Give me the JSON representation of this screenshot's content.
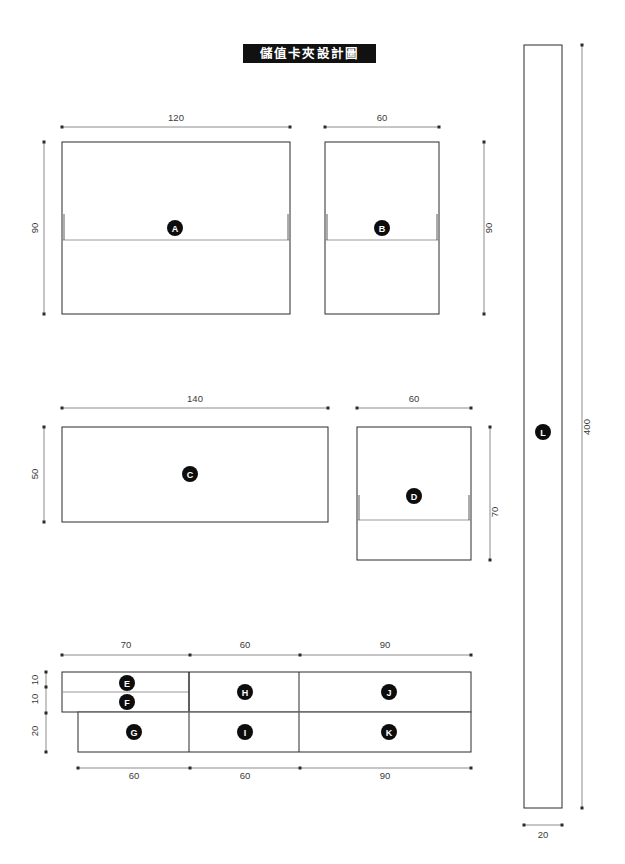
{
  "title": {
    "text": "儲值卡夾設計圖"
  },
  "drawing": {
    "type": "technical-drawing",
    "unit_note": "mm",
    "panels": [
      {
        "id": "A",
        "label": "A",
        "width": 120,
        "height": 90,
        "fold": true,
        "notches": true
      },
      {
        "id": "B",
        "label": "B",
        "width": 60,
        "height": 90,
        "fold": true,
        "notches": true
      },
      {
        "id": "C",
        "label": "C",
        "width": 140,
        "height": 50,
        "fold": false,
        "notches": false
      },
      {
        "id": "D",
        "label": "D",
        "width": 60,
        "height": 70,
        "fold": true,
        "notches": true
      },
      {
        "id": "E",
        "label": "E",
        "width": 70,
        "height": 10,
        "fold": false,
        "notches": false
      },
      {
        "id": "F",
        "label": "F",
        "width": 70,
        "height": 10,
        "fold": false,
        "notches": false
      },
      {
        "id": "G",
        "label": "G",
        "width": 60,
        "height": 20,
        "fold": false,
        "notches": false
      },
      {
        "id": "H",
        "label": "H",
        "width": 60,
        "height": 20,
        "fold": false,
        "notches": false
      },
      {
        "id": "I",
        "label": "I",
        "width": 60,
        "height": 20,
        "fold": false,
        "notches": false
      },
      {
        "id": "J",
        "label": "J",
        "width": 90,
        "height": 20,
        "fold": false,
        "notches": false
      },
      {
        "id": "K",
        "label": "K",
        "width": 90,
        "height": 20,
        "fold": false,
        "notches": false
      },
      {
        "id": "L",
        "label": "L",
        "width": 20,
        "height": 400,
        "fold": false,
        "notches": false
      }
    ],
    "dimensions": {
      "a_width": "120",
      "a_height": "90",
      "b_width": "60",
      "b_height": "90",
      "c_width": "140",
      "c_height": "50",
      "d_width": "60",
      "d_height": "70",
      "l_height": "400",
      "l_width": "20",
      "strip_top": [
        "70",
        "60",
        "90"
      ],
      "strip_bottom": [
        "60",
        "60",
        "90"
      ],
      "strip_left": [
        "10",
        "10",
        "20"
      ]
    }
  },
  "colors": {
    "ink": "#2b2b2b",
    "fold": "#8d8d8d",
    "dim": "#6f6f6f",
    "title_bg": "#111111",
    "title_fg": "#ffffff",
    "marker_bg": "#0d0d0d",
    "paper": "#ffffff"
  }
}
